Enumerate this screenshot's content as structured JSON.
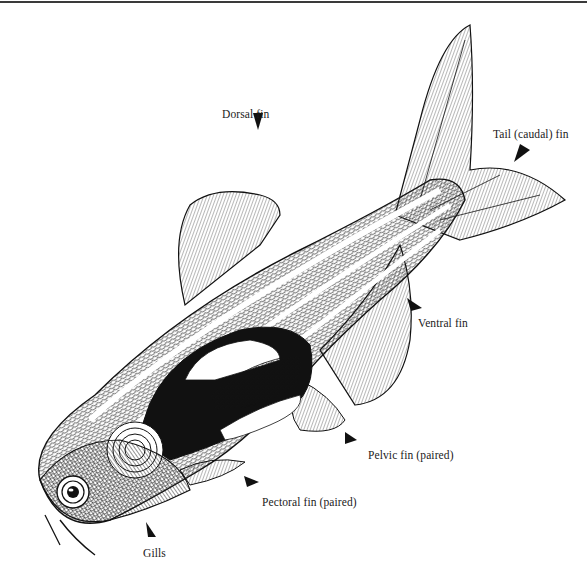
{
  "figure": {
    "colors": {
      "ink": "#111111",
      "paper": "#ffffff",
      "rule": "#3a3a3a"
    }
  },
  "labels": {
    "dorsal_fin": "Dorsal fin",
    "tail_fin": "Tail (caudal) fin",
    "ventral_fin": "Ventral fin",
    "pelvic_fin": "Pelvic fin (paired)",
    "pectoral_fin": "Pectoral fin (paired)",
    "gills": "Gills"
  }
}
